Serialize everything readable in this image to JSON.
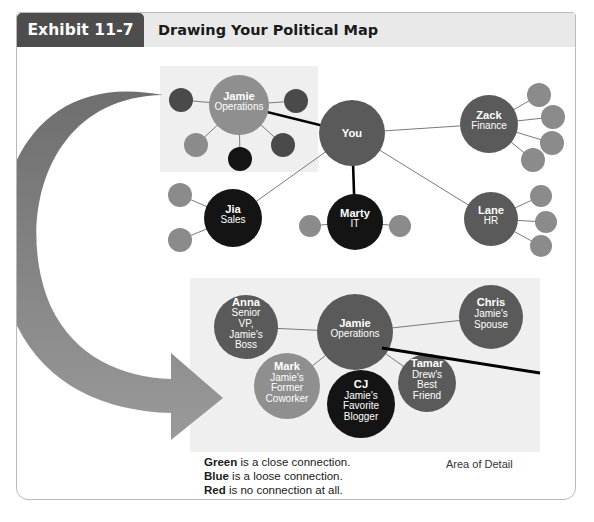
{
  "exhibit": {
    "tab_label": "Exhibit 11-7",
    "title": "Drawing Your Political Map"
  },
  "colors": {
    "tab_background": "#4d4d4d",
    "header_background": "#e9e9e9",
    "frame_border": "#b9b9b9",
    "node_dark": "#141414",
    "node_medium": "#5a5a5a",
    "node_light": "#8f8f8f",
    "satellite_dark": "#4a4a4a",
    "satellite_light": "#8b8b8b",
    "highlight_box": "#efefef",
    "arrow_top": "#6e6e6e",
    "arrow_bottom": "#9a9a9a",
    "link_thin": "#7a7a7a",
    "link_thick": "#000000"
  },
  "overview_map": {
    "name": "overview-political-map",
    "nodes": [
      {
        "id": "you",
        "label": "You",
        "sublabel": "",
        "shade": "medium",
        "cx": 352,
        "cy": 133,
        "r": 33
      },
      {
        "id": "jamie",
        "label": "Jamie",
        "sublabel": "Operations",
        "shade": "light",
        "cx": 239,
        "cy": 105,
        "r": 30
      },
      {
        "id": "zack",
        "label": "Zack",
        "sublabel": "Finance",
        "shade": "medium",
        "cx": 489,
        "cy": 124,
        "r": 29
      },
      {
        "id": "lane",
        "label": "Lane",
        "sublabel": "HR",
        "shade": "medium",
        "cx": 491,
        "cy": 219,
        "r": 27
      },
      {
        "id": "marty",
        "label": "Marty",
        "sublabel": "IT",
        "shade": "dark",
        "cx": 355,
        "cy": 222,
        "r": 28
      },
      {
        "id": "jia",
        "label": "Jia",
        "sublabel": "Sales",
        "shade": "dark",
        "cx": 233,
        "cy": 218,
        "r": 29
      }
    ],
    "satellites": [
      {
        "parent": "jamie",
        "cx": 181,
        "cy": 100,
        "r": 12,
        "shade": "satellite_dark"
      },
      {
        "parent": "jamie",
        "cx": 296,
        "cy": 101,
        "r": 12,
        "shade": "satellite_dark"
      },
      {
        "parent": "jamie",
        "cx": 196,
        "cy": 145,
        "r": 12,
        "shade": "satellite_light"
      },
      {
        "parent": "jamie",
        "cx": 283,
        "cy": 145,
        "r": 12,
        "shade": "satellite_dark"
      },
      {
        "parent": "jamie",
        "cx": 240,
        "cy": 159,
        "r": 12,
        "shade": "node_dark"
      },
      {
        "parent": "zack",
        "cx": 539,
        "cy": 95,
        "r": 12,
        "shade": "satellite_light"
      },
      {
        "parent": "zack",
        "cx": 553,
        "cy": 117,
        "r": 12,
        "shade": "satellite_light"
      },
      {
        "parent": "zack",
        "cx": 552,
        "cy": 143,
        "r": 12,
        "shade": "satellite_light"
      },
      {
        "parent": "zack",
        "cx": 533,
        "cy": 160,
        "r": 12,
        "shade": "satellite_light"
      },
      {
        "parent": "lane",
        "cx": 541,
        "cy": 196,
        "r": 11,
        "shade": "satellite_light"
      },
      {
        "parent": "lane",
        "cx": 546,
        "cy": 222,
        "r": 11,
        "shade": "satellite_light"
      },
      {
        "parent": "lane",
        "cx": 541,
        "cy": 246,
        "r": 11,
        "shade": "satellite_light"
      },
      {
        "parent": "marty",
        "cx": 310,
        "cy": 226,
        "r": 11,
        "shade": "satellite_light"
      },
      {
        "parent": "marty",
        "cx": 400,
        "cy": 226,
        "r": 11,
        "shade": "satellite_light"
      },
      {
        "parent": "jia",
        "cx": 180,
        "cy": 195,
        "r": 12,
        "shade": "satellite_light"
      },
      {
        "parent": "jia",
        "cx": 180,
        "cy": 240,
        "r": 12,
        "shade": "satellite_light"
      }
    ],
    "links": [
      {
        "from": "you",
        "to": "jamie",
        "weight": "thick"
      },
      {
        "from": "you",
        "to": "zack",
        "weight": "thin"
      },
      {
        "from": "you",
        "to": "marty",
        "weight": "thick"
      },
      {
        "from": "you",
        "to": "lane",
        "weight": "thin"
      },
      {
        "from": "you",
        "to": "jia",
        "weight": "thin"
      }
    ],
    "highlight_region": {
      "x": 160,
      "y": 66,
      "width": 158,
      "height": 106
    }
  },
  "detail_map": {
    "name": "detail-political-map",
    "region": {
      "x": 190,
      "y": 278,
      "width": 350,
      "height": 174
    },
    "nodes": [
      {
        "id": "jamie_d",
        "label": "Jamie",
        "sublabel": "Operations",
        "shade": "medium",
        "cx": 355,
        "cy": 332,
        "r": 38
      },
      {
        "id": "anna",
        "label": "Anna",
        "sublabel": "Senior VP, Jamie's Boss",
        "shade": "medium",
        "cx": 246,
        "cy": 327,
        "r": 32
      },
      {
        "id": "chris",
        "label": "Chris",
        "sublabel": "Jamie's Spouse",
        "shade": "medium",
        "cx": 491,
        "cy": 317,
        "r": 32
      },
      {
        "id": "mark",
        "label": "Mark",
        "sublabel": "Jamie's Former Coworker",
        "shade": "light",
        "cx": 287,
        "cy": 386,
        "r": 33
      },
      {
        "id": "cj",
        "label": "CJ",
        "sublabel": "Jamie's Favorite Blogger",
        "shade": "dark",
        "cx": 361,
        "cy": 404,
        "r": 34
      },
      {
        "id": "tamar",
        "label": "Tamar",
        "sublabel": "Drew's Best Friend",
        "shade": "medium",
        "cx": 427,
        "cy": 383,
        "r": 29
      }
    ],
    "links": [
      {
        "from": "jamie_d",
        "to": "anna",
        "weight": "thin"
      },
      {
        "from": "jamie_d",
        "to": "chris",
        "weight": "thin"
      },
      {
        "from": "jamie_d",
        "to": "mark",
        "weight": "thin"
      },
      {
        "from": "jamie_d",
        "to": "cj",
        "weight": "thin"
      },
      {
        "from": "jamie_d",
        "to": "tamar",
        "weight": "thin"
      }
    ]
  },
  "legend": {
    "lines": [
      {
        "key": "Green",
        "text": " is a close connection."
      },
      {
        "key": "Blue",
        "text": " is a loose connection."
      },
      {
        "key": "Red",
        "text": " is no connection at all."
      }
    ],
    "area_of_detail_label": "Area of Detail"
  }
}
